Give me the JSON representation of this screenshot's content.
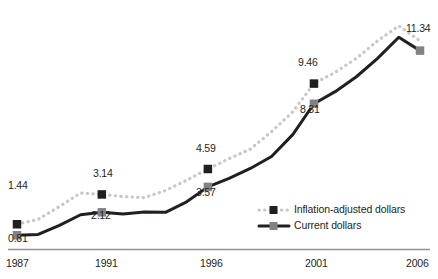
{
  "chart_data": {
    "type": "line",
    "title": "",
    "subtitle": "",
    "xlabel": "",
    "ylabel": "",
    "grid": false,
    "legend_position": "inside-bottom-right",
    "x": [
      1987,
      1988,
      1989,
      1990,
      1991,
      1992,
      1993,
      1994,
      1995,
      1996,
      1997,
      1998,
      1999,
      2000,
      2001,
      2002,
      2003,
      2004,
      2005,
      2006
    ],
    "xlim": [
      1987,
      2006
    ],
    "ylim": [
      0,
      13.2
    ],
    "tick_labels": [
      "1987",
      "1991",
      "1996",
      "2001",
      "2006"
    ],
    "tick_values": [
      1987,
      1991,
      1996,
      2001,
      2006
    ],
    "series": [
      {
        "name": "Inflation-adjusted dollars",
        "line_style": "dotted",
        "line_color": "#c8c8c8",
        "marker": "square",
        "marker_color": "#231f20",
        "values": [
          1.44,
          1.72,
          2.45,
          3.22,
          3.14,
          3.02,
          2.96,
          3.36,
          3.95,
          4.59,
          5.18,
          5.72,
          6.72,
          7.85,
          9.46,
          10.1,
          10.9,
          11.9,
          12.75,
          11.9
        ],
        "labeled_points": [
          {
            "x": 1987,
            "value": 1.44,
            "label": "1.44"
          },
          {
            "x": 1991,
            "value": 3.14,
            "label": "3.14"
          },
          {
            "x": 1996,
            "value": 4.59,
            "label": "4.59"
          },
          {
            "x": 2001,
            "value": 9.46,
            "label": "9.46"
          }
        ]
      },
      {
        "name": "Current dollars",
        "line_style": "solid",
        "line_color": "#231f20",
        "marker": "square",
        "marker_color": "#808285",
        "values": [
          0.81,
          0.86,
          1.38,
          1.98,
          2.12,
          2.02,
          2.14,
          2.12,
          2.72,
          3.57,
          4.06,
          4.62,
          5.3,
          6.55,
          8.31,
          9.0,
          9.85,
          10.9,
          12.1,
          11.34
        ],
        "labeled_points": [
          {
            "x": 1987,
            "value": 0.81,
            "label": "0.81"
          },
          {
            "x": 1991,
            "value": 2.12,
            "label": "2.12"
          },
          {
            "x": 1996,
            "value": 3.57,
            "label": "3.57"
          },
          {
            "x": 2001,
            "value": 8.31,
            "label": "8.31"
          },
          {
            "x": 2006,
            "value": 11.34,
            "label": "11.34"
          }
        ]
      }
    ]
  },
  "axis": {
    "ticks": [
      {
        "label": "1987"
      },
      {
        "label": "1991"
      },
      {
        "label": "1996"
      },
      {
        "label": "2001"
      },
      {
        "label": "2006"
      }
    ],
    "line_color": "#939598"
  },
  "value_labels": {
    "inflation_1987": "1.44",
    "inflation_1991": "3.14",
    "inflation_1996": "4.59",
    "inflation_2001": "9.46",
    "current_1987": "0.81",
    "current_1991": "2.12",
    "current_1996": "3.57",
    "current_2001": "8.31",
    "current_2006": "11.34"
  },
  "legend": {
    "items": [
      {
        "label": "Inflation-adjusted dollars",
        "style": "dotted",
        "marker_color": "#231f20",
        "line_color": "#c8c8c8"
      },
      {
        "label": "Current dollars",
        "style": "solid",
        "marker_color": "#808285",
        "line_color": "#231f20"
      }
    ]
  },
  "colors": {
    "ink": "#231f20",
    "dotted_line": "#c8c8c8",
    "solid_line": "#231f20",
    "gray_marker": "#808285",
    "axis": "#939598",
    "background": "#ffffff"
  }
}
